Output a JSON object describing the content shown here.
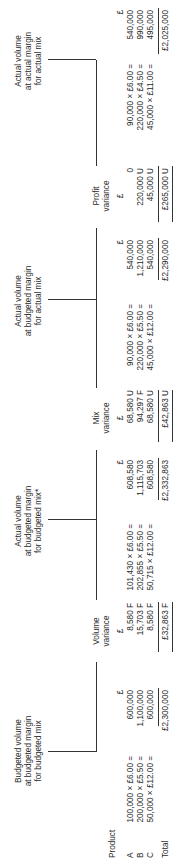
{
  "headers": {
    "product": "Product",
    "budgeted": [
      "Budgeted volume",
      "at budgeted margin",
      "for budgeted mix"
    ],
    "volume_variance": [
      "Volume",
      "variance"
    ],
    "actual_budgeted_mix": [
      "Actual volume",
      "at budgeted margin",
      "for budgeted mix*"
    ],
    "mix_variance": [
      "Mix",
      "variance"
    ],
    "actual_actual_mix": [
      "Actual volume",
      "at budgeted margin",
      "for actual mix"
    ],
    "profit_variance": [
      "Profit",
      "variance"
    ],
    "actual_actual_margin": [
      "Actual volume",
      "at actual margin",
      "for actual mix"
    ]
  },
  "currency": "£",
  "rows": [
    {
      "product": "A",
      "b_calc": "100,000 × £6.00 =",
      "b_val": "600,000",
      "vol_var": "8,580 F",
      "abm_calc": "101,430 × £6.00 =",
      "abm_val": "608,580",
      "mix_var": "68,580 U",
      "aam_calc": "90,000 × £6.00 =",
      "aam_val": "540,000",
      "profit_var": "0",
      "aa_calc": "90,000 × £6.00 =",
      "aa_val": "540,000"
    },
    {
      "product": "B",
      "b_calc": "200,000 × £5.50 =",
      "b_val": "1,100,000",
      "vol_var": "15,703 F",
      "abm_calc": "202,855 × £5.50 =",
      "abm_val": "1,115,703",
      "mix_var": "94,297 F",
      "aam_calc": "220,000 × £5.50 =",
      "aam_val": "1,210,000",
      "profit_var": "220,000 U",
      "aa_calc": "220,000 × £4.50 =",
      "aa_val": "990,000"
    },
    {
      "product": "C",
      "b_calc": "50,000 × £12.00 =",
      "b_val": "600,000",
      "vol_var": "8,580 F",
      "abm_calc": "50,715 × £12.00 =",
      "abm_val": "608,580",
      "mix_var": "68,580 U",
      "aam_calc": "45,000 × £12.00 =",
      "aam_val": "540,000",
      "profit_var": "45,000 U",
      "aa_calc": "45,000 × £11.00 =",
      "aa_val": "495,000"
    }
  ],
  "totals": {
    "label": "Total",
    "budgeted": "£2,300,000",
    "volume_variance": "£32,863 F",
    "actual_budgeted_mix": "£2,332,863",
    "mix_variance": "£42,863 U",
    "actual_actual_mix": "£2,290,000",
    "profit_variance": "£265,000 U",
    "actual_actual_margin": "£2,025,000"
  }
}
